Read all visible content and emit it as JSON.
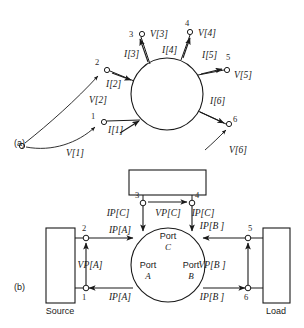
{
  "figure": {
    "width": 304,
    "height": 328,
    "background": "#ffffff",
    "ink": "#1a1a1a"
  },
  "panels": [
    {
      "key": "a",
      "label": "(a)",
      "x": 14,
      "y": 146
    },
    {
      "key": "b",
      "label": "(b)",
      "x": 14,
      "y": 290
    }
  ],
  "panel_a": {
    "network": {
      "cx": 167,
      "cy": 94,
      "r": 36
    },
    "common_node": {
      "x": 22,
      "y": 146,
      "r": 2.6
    },
    "terminals": [
      {
        "id": "1",
        "num": "1",
        "nx": 104,
        "ny": 122,
        "r": 2.6,
        "num_x": 93,
        "num_y": 119,
        "current_label": "I[1]",
        "ilx": 108,
        "ily": 133,
        "voltage_label": "V[1]",
        "vlx": 66,
        "vly": 156,
        "arr_x1": 120,
        "arr_y1": 133,
        "arr_x2": 139,
        "arr_y2": 121,
        "stub_x1": 107,
        "stub_y1": 121,
        "stub_x2": 140,
        "stub_y2": 120,
        "vcurve": "M26,147 C52,152 78,143 95,127",
        "vtipx": 100,
        "vtipy": 123
      },
      {
        "id": "2",
        "num": "2",
        "nx": 107,
        "ny": 70,
        "r": 2.6,
        "num_x": 97,
        "num_y": 65,
        "current_label": "I[2]",
        "ilx": 106,
        "ily": 87,
        "voltage_label": "V[2]",
        "vlx": 89,
        "vly": 103,
        "arr_x1": 112,
        "arr_y1": 73,
        "arr_x2": 131,
        "arr_y2": 80,
        "stub_x1": 110,
        "stub_y1": 71,
        "stub_x2": 134,
        "stub_y2": 81,
        "vcurve": "M25,143 C49,124 76,100 98,76",
        "vtipx": 103,
        "vtipy": 71
      },
      {
        "id": "3",
        "num": "3",
        "nx": 142,
        "ny": 34,
        "r": 2.6,
        "num_x": 131,
        "num_y": 37,
        "current_label": "I[3]",
        "ilx": 124,
        "ily": 57,
        "voltage_label": "V[3]",
        "vlx": 150,
        "vly": 37,
        "arr_x1": 148,
        "arr_y1": 62,
        "arr_x2": 140,
        "arr_y2": 39,
        "stub_x1": 141,
        "stub_y1": 37,
        "stub_x2": 150,
        "stub_y2": 64
      },
      {
        "id": "4",
        "num": "4",
        "nx": 190,
        "ny": 32,
        "r": 2.6,
        "num_x": 187,
        "num_y": 26,
        "current_label": "I[4]",
        "ilx": 162,
        "ily": 53,
        "voltage_label": "V[4]",
        "vlx": 198,
        "vly": 36,
        "arr_x1": 183,
        "arr_y1": 58,
        "arr_x2": 190,
        "arr_y2": 38,
        "stub_x1": 190,
        "stub_y1": 35,
        "stub_x2": 181,
        "stub_y2": 60
      },
      {
        "id": "5",
        "num": "5",
        "nx": 227,
        "ny": 70,
        "r": 2.6,
        "num_x": 228,
        "num_y": 60,
        "current_label": "I[5]",
        "ilx": 202,
        "ily": 58,
        "voltage_label": "V[5]",
        "vlx": 234,
        "vly": 78,
        "arr_x1": 201,
        "arr_y1": 74,
        "arr_x2": 222,
        "arr_y2": 69,
        "stub_x1": 198,
        "stub_y1": 75,
        "stub_x2": 224,
        "stub_y2": 70
      },
      {
        "id": "6",
        "num": "6",
        "nx": 229,
        "ny": 124,
        "r": 2.6,
        "num_x": 235,
        "num_y": 122,
        "current_label": "I[6]",
        "ilx": 210,
        "ily": 104,
        "voltage_label": "V[6]",
        "vlx": 229,
        "vly": 153,
        "arr_x1": 200,
        "arr_y1": 112,
        "arr_x2": 224,
        "arr_y2": 123,
        "stub_x1": 198,
        "stub_y1": 111,
        "stub_x2": 226,
        "stub_y2": 124,
        "vcurve": "M205,150 C213,143 219,137 226,130",
        "vtipx": 230,
        "vtipy": 126
      }
    ]
  },
  "panel_b": {
    "network": {
      "cx": 168,
      "cy": 265,
      "r": 37
    },
    "ports": [
      {
        "name": "Port",
        "letter": "A",
        "x": 148,
        "y": 268,
        "ly": 279
      },
      {
        "name": "Port",
        "letter": "B",
        "x": 191,
        "y": 268,
        "ly": 279
      },
      {
        "name": "Port",
        "letter": "C",
        "x": 168,
        "y": 239,
        "ly": 250
      }
    ],
    "blocks": [
      {
        "key": "source",
        "label": "Source",
        "x": 46,
        "y": 228,
        "w": 29,
        "h": 75,
        "lx": 60,
        "ly": 314
      },
      {
        "key": "load",
        "label": "Load",
        "x": 263,
        "y": 228,
        "w": 27,
        "h": 75,
        "lx": 276,
        "ly": 314
      },
      {
        "key": "third",
        "label": "",
        "x": 129,
        "y": 170,
        "w": 77,
        "h": 25,
        "lx": 167,
        "ly": 184
      }
    ],
    "terminals": [
      {
        "id": "1",
        "num": "1",
        "nx": 86,
        "ny": 288,
        "r": 2.8,
        "num_x": 84,
        "num_y": 300
      },
      {
        "id": "2",
        "num": "2",
        "nx": 86,
        "ny": 238,
        "r": 2.8,
        "num_x": 84,
        "num_y": 231
      },
      {
        "id": "3",
        "num": "3",
        "nx": 143,
        "ny": 203,
        "r": 2.8,
        "num_x": 137,
        "num_y": 198
      },
      {
        "id": "4",
        "num": "4",
        "nx": 192,
        "ny": 203,
        "r": 2.8,
        "num_x": 197,
        "num_y": 198
      },
      {
        "id": "5",
        "num": "5",
        "nx": 248,
        "ny": 238,
        "r": 2.8,
        "num_x": 250,
        "num_y": 231
      },
      {
        "id": "6",
        "num": "6",
        "nx": 248,
        "ny": 288,
        "r": 2.8,
        "num_x": 246,
        "num_y": 300
      }
    ],
    "currents": [
      {
        "label": "IP[A]",
        "lx": 120,
        "ly": 233,
        "x1": 89,
        "y1": 238,
        "x2": 133,
        "y2": 238,
        "dir": "right"
      },
      {
        "label": "IP[A]",
        "lx": 120,
        "ly": 300,
        "x1": 133,
        "y1": 288,
        "x2": 89,
        "y2": 288,
        "dir": "left"
      },
      {
        "label": "IP[B ]",
        "lx": 212,
        "ly": 229,
        "x1": 245,
        "y1": 238,
        "x2": 203,
        "y2": 238,
        "dir": "left"
      },
      {
        "label": "IP[B ]",
        "lx": 212,
        "ly": 300,
        "x1": 203,
        "y1": 288,
        "x2": 245,
        "y2": 288,
        "dir": "right"
      },
      {
        "label": "IP[C]",
        "lx": 118,
        "ly": 216,
        "x1": 143,
        "y1": 206,
        "x2": 143,
        "y2": 231,
        "dir": "down"
      },
      {
        "label": "IP[C]",
        "lx": 203,
        "ly": 216,
        "x1": 192,
        "y1": 206,
        "x2": 192,
        "y2": 231,
        "dir": "down"
      }
    ],
    "voltages": [
      {
        "label": "VP[A]",
        "lx": 90,
        "ly": 268,
        "x1": 86,
        "y1": 285,
        "x2": 86,
        "y2": 243,
        "dir": "up"
      },
      {
        "label": "VP[B ]",
        "lx": 212,
        "ly": 268,
        "x1": 248,
        "y1": 285,
        "x2": 248,
        "y2": 243,
        "dir": "up"
      },
      {
        "label": "VP[C]",
        "lx": 168,
        "ly": 216,
        "x1": 148,
        "y1": 202,
        "x2": 187,
        "y2": 202,
        "dir": "right"
      }
    ],
    "leads": [
      {
        "x1": 75,
        "y1": 238,
        "x2": 86,
        "y2": 238
      },
      {
        "x1": 75,
        "y1": 288,
        "x2": 86,
        "y2": 288
      },
      {
        "x1": 248,
        "y1": 238,
        "x2": 263,
        "y2": 238
      },
      {
        "x1": 248,
        "y1": 288,
        "x2": 263,
        "y2": 288
      },
      {
        "x1": 143,
        "y1": 195,
        "x2": 143,
        "y2": 203
      },
      {
        "x1": 192,
        "y1": 195,
        "x2": 192,
        "y2": 203
      }
    ]
  }
}
